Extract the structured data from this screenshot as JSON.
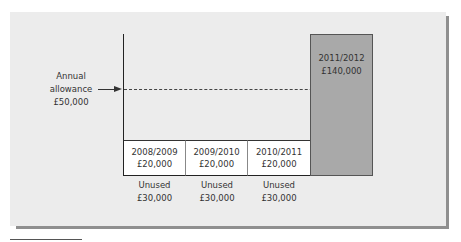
{
  "diagram": {
    "annual_allowance": {
      "line1": "Annual",
      "line2": "allowance",
      "line3": "£50,000"
    },
    "years": [
      {
        "year": "2008/2009",
        "amount": "£20,000",
        "unused_label": "Unused",
        "unused_amount": "£30,000"
      },
      {
        "year": "2009/2010",
        "amount": "£20,000",
        "unused_label": "Unused",
        "unused_amount": "£30,000"
      },
      {
        "year": "2010/2011",
        "amount": "£20,000",
        "unused_label": "Unused",
        "unused_amount": "£30,000"
      }
    ],
    "highlight": {
      "year": "2011/2012",
      "amount": "£140,000"
    },
    "colors": {
      "panel": "#ececec",
      "shadow": "#8f8f8f",
      "highlight_bar": "#a9a9a9",
      "box": "#ffffff"
    }
  },
  "chart_data": {
    "type": "bar",
    "title": "",
    "categories": [
      "2008/2009",
      "2009/2010",
      "2010/2011",
      "2011/2012"
    ],
    "series": [
      {
        "name": "Contribution",
        "values": [
          20000,
          20000,
          20000,
          140000
        ]
      },
      {
        "name": "Unused allowance",
        "values": [
          30000,
          30000,
          30000,
          null
        ]
      }
    ],
    "annotations": [
      {
        "type": "hline",
        "value": 50000,
        "label": "Annual allowance £50,000",
        "style": "dashed"
      }
    ],
    "xlabel": "",
    "ylabel": "",
    "grid": false,
    "legend": "none"
  }
}
